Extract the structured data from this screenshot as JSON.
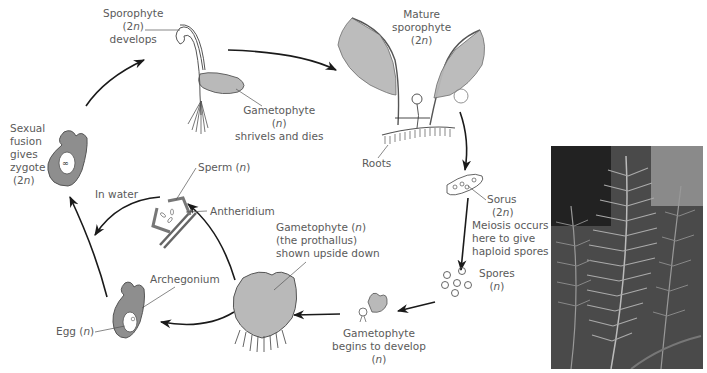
{
  "labels": {
    "sporophyte_develops": [
      "Sporophyte",
      "(2n)",
      "develops"
    ],
    "gametophyte_shrivels": [
      "Gametophyte",
      "(n)",
      "shrivels and dies"
    ],
    "mature_sporophyte": [
      "Mature",
      "sporophyte",
      "(2n)"
    ],
    "roots": "Roots",
    "sorus": [
      "Sorus",
      "(2n)"
    ],
    "meiosis": [
      "Meiosis occurs",
      "here to give",
      "haploid spores"
    ],
    "spores": [
      "Spores",
      "(n)"
    ],
    "gametophyte_begins": [
      "Gametophyte",
      "begins to develop",
      "(n)"
    ],
    "prothallus": [
      "Gametophyte (n)",
      "(the prothallus)",
      "shown upside down"
    ],
    "sperm": "Sperm  (n)",
    "antheridium": "Antheridium",
    "in_water": "In water",
    "archegonium": "Archegonium",
    "egg": "Egg (n)",
    "sexual_fusion": [
      "Sexual",
      "fusion",
      "gives",
      "zygote",
      "(2n)"
    ]
  },
  "photo": {
    "subject": "fern-fronds-photograph"
  },
  "colors": {
    "fill": "#b9b9b9",
    "stroke": "#555555",
    "arrow": "#1a1a1a",
    "cell": "#8e8e8e"
  }
}
